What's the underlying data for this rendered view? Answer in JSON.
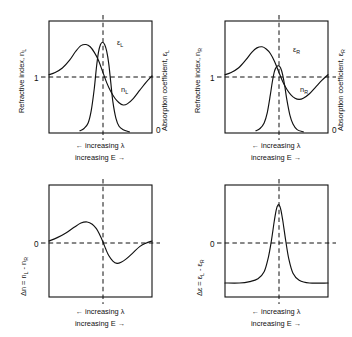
{
  "figure": {
    "caption_lambda": "← increasing λ",
    "caption_energy": "increasing E →"
  },
  "panels": {
    "top_left": {
      "name": "left-circularly-polarized-panel",
      "y_left_title_main": "Refractive index, n",
      "y_left_title_sub": "L",
      "y_right_title_main": "Absorption coefficient, ε",
      "y_right_title_sub": "L",
      "tick_left": "1",
      "tick_right": "0",
      "label_absorption": "ε",
      "label_absorption_sub": "L",
      "label_refraction": "n",
      "label_refraction_sub": "L"
    },
    "top_right": {
      "name": "right-circularly-polarized-panel",
      "y_left_title_main": "Refractive index, n",
      "y_left_title_sub": "R",
      "y_right_title_main": "Absorption coefficient, ε",
      "y_right_title_sub": "R",
      "tick_left": "1",
      "tick_right": "0",
      "label_absorption": "ε",
      "label_absorption_sub": "R",
      "label_refraction": "n",
      "label_refraction_sub": "R"
    },
    "bottom_left": {
      "name": "ord-difference-panel",
      "y_title_prefix": "Δn = n",
      "y_title_sub1": "L",
      "y_title_mid": " - n",
      "y_title_sub2": "R",
      "tick_zero": "0"
    },
    "bottom_right": {
      "name": "cd-difference-panel",
      "y_title_prefix": "Δε = ε",
      "y_title_sub1": "L",
      "y_title_mid": " - ε",
      "y_title_sub2": "R",
      "tick_zero": "0"
    }
  },
  "chart_data": [
    {
      "id": "top_left",
      "type": "line",
      "title": "Left circularly polarized light: refractive index and absorption",
      "xlabel": "← increasing λ  /  increasing E →",
      "ylabel": "Refractive index, n_L",
      "ylabel_right": "Absorption coefficient, ε_L",
      "xlim": [
        0,
        100
      ],
      "ylim": [
        0,
        100
      ],
      "grid": false,
      "legend": "inline-labels",
      "baseline_y": 55,
      "center_x": 52,
      "annotations": [
        {
          "text": "ε_L",
          "x": 67,
          "y": 28
        },
        {
          "text": "n_L",
          "x": 71,
          "y": 62
        }
      ],
      "series": [
        {
          "name": "n_L",
          "comment": "anomalous dispersion: rise, max left of resonance, steep fall through centre, min right, recovery",
          "x": [
            0,
            6,
            13,
            20,
            26,
            31,
            36,
            40,
            44,
            48,
            52,
            56,
            60,
            64,
            68,
            72,
            76,
            82,
            88,
            94,
            100
          ],
          "y": [
            52,
            54,
            58,
            65,
            73,
            78,
            79,
            77,
            72,
            65,
            55,
            45,
            37,
            31,
            27,
            25,
            26,
            31,
            38,
            45,
            51
          ]
        },
        {
          "name": "ε_L",
          "comment": "tall narrow absorption band centred on resonance",
          "x": [
            30,
            34,
            38,
            41,
            44,
            46,
            48,
            50,
            52,
            54,
            56,
            58,
            60,
            62,
            65,
            68,
            72,
            78
          ],
          "y": [
            2,
            4,
            9,
            20,
            40,
            58,
            72,
            79,
            81,
            79,
            73,
            62,
            45,
            28,
            13,
            6,
            3,
            1
          ]
        }
      ]
    },
    {
      "id": "top_right",
      "type": "line",
      "title": "Right circularly polarized light: refractive index and absorption",
      "xlabel": "← increasing λ  /  increasing E →",
      "ylabel": "Refractive index, n_R",
      "ylabel_right": "Absorption coefficient, ε_R",
      "xlim": [
        0,
        100
      ],
      "ylim": [
        0,
        100
      ],
      "grid": false,
      "legend": "inline-labels",
      "baseline_y": 55,
      "center_x": 52,
      "annotations": [
        {
          "text": "ε_R",
          "x": 67,
          "y": 35
        },
        {
          "text": "n_R",
          "x": 73,
          "y": 62
        }
      ],
      "series": [
        {
          "name": "n_R",
          "comment": "same anomalous dispersion but smaller amplitude swing than n_L",
          "x": [
            0,
            6,
            13,
            20,
            26,
            31,
            36,
            40,
            44,
            48,
            52,
            56,
            60,
            64,
            68,
            72,
            76,
            82,
            88,
            94,
            100
          ],
          "y": [
            52,
            54,
            58,
            65,
            72,
            76,
            77,
            75,
            71,
            64,
            55,
            46,
            39,
            34,
            31,
            30,
            31,
            35,
            41,
            47,
            52
          ]
        },
        {
          "name": "ε_R",
          "comment": "narrower and markedly shorter absorption band than ε_L",
          "x": [
            30,
            34,
            38,
            41,
            44,
            46,
            48,
            50,
            52,
            54,
            56,
            58,
            60,
            63,
            66,
            70,
            76
          ],
          "y": [
            2,
            4,
            9,
            18,
            34,
            46,
            55,
            59,
            60,
            58,
            52,
            42,
            30,
            16,
            8,
            3,
            1
          ]
        }
      ]
    },
    {
      "id": "bottom_left",
      "type": "line",
      "title": "Circular birefringence (ORD) difference curve",
      "xlabel": "← increasing λ  /  increasing E →",
      "ylabel": "Δn = n_L - n_R",
      "xlim": [
        0,
        100
      ],
      "ylim": [
        -50,
        50
      ],
      "grid": false,
      "zero_line": 0,
      "center_x": 52,
      "series": [
        {
          "name": "Δn",
          "comment": "S-shaped Cotton-effect ORD curve: positive lobe then negative lobe, crossing zero at resonance",
          "x": [
            0,
            8,
            16,
            24,
            31,
            37,
            42,
            46,
            49,
            52,
            55,
            58,
            62,
            66,
            70,
            75,
            81,
            88,
            94,
            100
          ],
          "y": [
            0,
            3,
            7,
            12,
            16,
            17,
            15,
            11,
            6,
            0,
            -7,
            -13,
            -18,
            -20,
            -19,
            -16,
            -11,
            -5,
            -2,
            0
          ]
        }
      ]
    },
    {
      "id": "bottom_right",
      "type": "line",
      "title": "Circular dichroism (CD) difference curve",
      "xlabel": "← increasing λ  /  increasing E →",
      "ylabel": "Δε = ε_L - ε_R",
      "xlim": [
        0,
        100
      ],
      "ylim": [
        -10,
        70
      ],
      "grid": false,
      "zero_line": 0,
      "center_x": 52,
      "series": [
        {
          "name": "Δε",
          "comment": "single positive gaussian band centred on resonance",
          "x": [
            0,
            14,
            24,
            32,
            38,
            42,
            45,
            48,
            50,
            52,
            54,
            56,
            59,
            62,
            66,
            72,
            82,
            100
          ],
          "y": [
            0,
            0,
            1,
            3,
            8,
            18,
            30,
            45,
            53,
            56,
            53,
            45,
            30,
            17,
            7,
            2,
            0,
            0
          ]
        }
      ]
    }
  ]
}
